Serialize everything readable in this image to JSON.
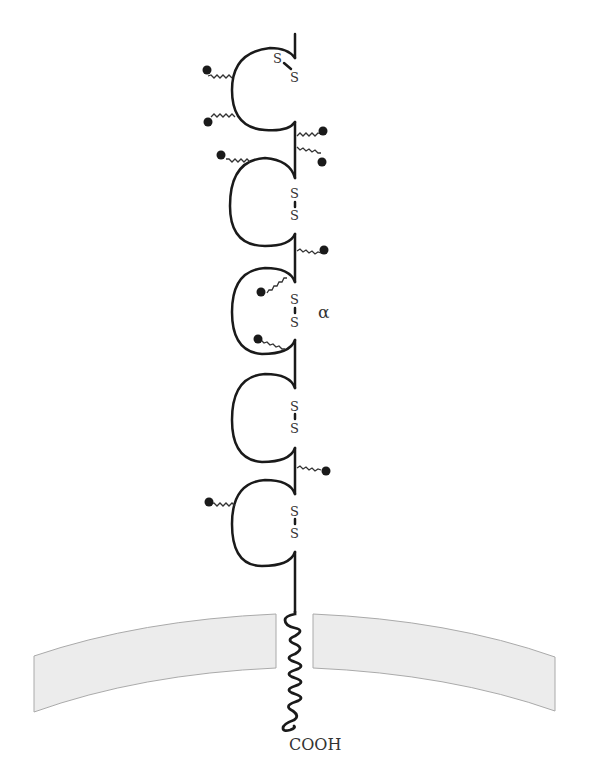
{
  "diagram": {
    "type": "membrane-glycoprotein-schematic",
    "colors": {
      "line": "#1a1a1a",
      "membrane_fill": "#ececec",
      "membrane_edge": "#aaaaaa",
      "text": "#333333"
    },
    "labels": {
      "chain": "α",
      "terminus": "COOH"
    },
    "domains": [
      {
        "id": 1,
        "disulfide": [
          "S",
          "S"
        ],
        "disulfide_style": "diagonal"
      },
      {
        "id": 2,
        "disulfide": [
          "S",
          "S"
        ],
        "disulfide_style": "vertical"
      },
      {
        "id": 3,
        "disulfide": [
          "S",
          "S"
        ],
        "disulfide_style": "vertical"
      },
      {
        "id": 4,
        "disulfide": [
          "S",
          "S"
        ],
        "disulfide_style": "vertical"
      },
      {
        "id": 5,
        "disulfide": [
          "S",
          "S"
        ],
        "disulfide_style": "vertical"
      }
    ],
    "glycosylation_sites": 11
  }
}
